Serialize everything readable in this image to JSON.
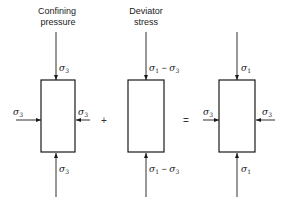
{
  "figure": {
    "panels": [
      {
        "title_line1": "Confining",
        "title_line2": "pressure",
        "top_label": "σ",
        "top_sub": "3",
        "bottom_label": "σ",
        "bottom_sub": "3",
        "left_label": "σ",
        "left_sub": "3",
        "right_label": "σ",
        "right_sub": "3"
      },
      {
        "title_line1": "Deviator",
        "title_line2": "stress",
        "top_label_a": "σ",
        "top_sub_a": "1",
        "top_minus": " − ",
        "top_label_b": "σ",
        "top_sub_b": "3",
        "bottom_label_a": "σ",
        "bottom_sub_a": "1",
        "bottom_minus": " − ",
        "bottom_label_b": "σ",
        "bottom_sub_b": "3"
      },
      {
        "top_label": "σ",
        "top_sub": "1",
        "bottom_label": "σ",
        "bottom_sub": "1",
        "left_label": "σ",
        "left_sub": "3",
        "right_label": "σ",
        "right_sub": "3"
      }
    ],
    "operators": {
      "plus": "+",
      "equals": "="
    }
  }
}
